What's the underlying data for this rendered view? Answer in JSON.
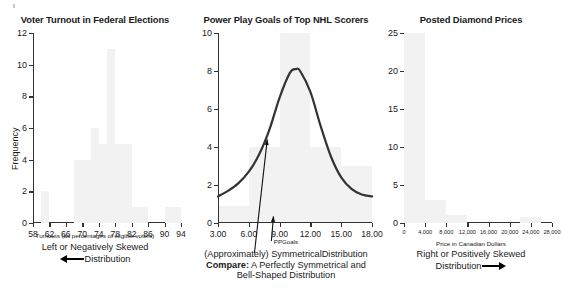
{
  "page": {
    "kind": "three-panel-skewness-figure",
    "background": "#ffffff",
    "bar_color": "#f2f2f2",
    "curve_color": "#333333"
  },
  "chart_data": [
    {
      "type": "bar",
      "panel": 1,
      "title": "Voter Turnout in Federal Elections",
      "xlabel": "Turnouts (as percentages of eligible voters)",
      "ylabel": "Frequency",
      "xlim": [
        58,
        94
      ],
      "ylim": [
        0,
        12
      ],
      "grid": false,
      "legend": "none",
      "xticks": [
        58,
        62,
        66,
        70,
        74,
        78,
        82,
        86,
        90,
        94
      ],
      "xtick_labels": [
        "58",
        "62",
        "66",
        "70",
        "74",
        "78",
        "82",
        "86",
        "90",
        "94"
      ],
      "yticks": [
        0,
        2,
        4,
        6,
        8,
        10,
        12
      ],
      "ytick_labels": [
        "0",
        "2",
        "4",
        "6",
        "8",
        "10",
        "12"
      ],
      "bin_width": 2,
      "bins": [
        {
          "x0": 60,
          "x1": 62,
          "value": 2
        },
        {
          "x0": 68,
          "x1": 70,
          "value": 4
        },
        {
          "x0": 70,
          "x1": 72,
          "value": 4
        },
        {
          "x0": 72,
          "x1": 74,
          "value": 6
        },
        {
          "x0": 74,
          "x1": 76,
          "value": 5
        },
        {
          "x0": 76,
          "x1": 78,
          "value": 11
        },
        {
          "x0": 78,
          "x1": 80,
          "value": 5
        },
        {
          "x0": 80,
          "x1": 82,
          "value": 5
        },
        {
          "x0": 82,
          "x1": 86,
          "value": 1
        },
        {
          "x0": 90,
          "x1": 94,
          "value": 1
        }
      ],
      "caption_line1": "Left or Negatively Skewed",
      "caption_line2": "Distribution",
      "caption_arrow": "left-arrow"
    },
    {
      "type": "line",
      "panel": 2,
      "title": "Power Play Goals of Top NHL Scorers",
      "xlabel": "PPGoals",
      "ylabel": "",
      "xlim": [
        3.0,
        18.0
      ],
      "ylim": [
        0,
        10
      ],
      "grid": false,
      "legend": "none",
      "xticks": [
        3.0,
        6.0,
        9.0,
        12.0,
        15.0,
        18.0
      ],
      "xtick_labels": [
        "3.00",
        "6.00",
        "9.00",
        "12.00",
        "15.00",
        "18.00"
      ],
      "yticks": [
        0,
        2,
        4,
        6,
        8,
        10
      ],
      "ytick_labels": [
        "0",
        "2",
        "4",
        "6",
        "8",
        "10"
      ],
      "curve": {
        "name": "Normal density overlay",
        "peak_x": 10.6,
        "peak_y": 8.1,
        "x": [
          3.0,
          4.0,
          5.0,
          6.0,
          7.0,
          8.0,
          9.0,
          10.0,
          10.6,
          11.0,
          12.0,
          13.0,
          14.0,
          15.0,
          16.0,
          17.0,
          18.0
        ],
        "y": [
          1.4,
          1.7,
          2.1,
          2.7,
          3.6,
          4.9,
          6.6,
          7.9,
          8.1,
          8.0,
          6.9,
          5.1,
          3.5,
          2.4,
          1.8,
          1.5,
          1.4
        ]
      },
      "bins": [
        {
          "x0": 3.0,
          "x1": 6.0,
          "value": 0.9
        },
        {
          "x0": 6.0,
          "x1": 9.0,
          "value": 4.0
        },
        {
          "x0": 9.0,
          "x1": 12.0,
          "value": 10.0
        },
        {
          "x0": 12.0,
          "x1": 15.0,
          "value": 4.0
        },
        {
          "x0": 15.0,
          "x1": 18.0,
          "value": 3.0
        }
      ],
      "annotations": [
        {
          "name": "curve-arrow",
          "label": "points at the fitted bell curve",
          "tip_x": 7.8,
          "tip_y": 4.4
        },
        {
          "name": "axis-arrow",
          "label": "points at the horizontal axis",
          "tip_x": 8.4,
          "tip_y": 0.35
        }
      ],
      "caption_line1": "(Approximately) SymmetricalDistribution",
      "caption_line2_bold": "Compare:",
      "caption_line2": " A Perfectly Symmetrical and",
      "caption_line3": "Bell-Shaped Distribution"
    },
    {
      "type": "bar",
      "panel": 3,
      "title": "Posted Diamond Prices",
      "xlabel": "Price in Canadian Dollars",
      "ylabel": "",
      "xlim": [
        0,
        28000
      ],
      "ylim": [
        0,
        25
      ],
      "grid": false,
      "legend": "none",
      "xticks": [
        0,
        4000,
        8000,
        12000,
        16000,
        20000,
        24000,
        28000
      ],
      "xtick_labels": [
        "0",
        "4,000",
        "8,000",
        "12,000",
        "16,000",
        "20,000",
        "24,000",
        "28,000"
      ],
      "yticks": [
        0,
        5,
        10,
        15,
        20,
        25
      ],
      "ytick_labels": [
        "0",
        "5",
        "10",
        "15",
        "20",
        "25"
      ],
      "bins": [
        {
          "x0": 0,
          "x1": 4000,
          "value": 25
        },
        {
          "x0": 4000,
          "x1": 8000,
          "value": 3
        },
        {
          "x0": 8000,
          "x1": 12000,
          "value": 1
        },
        {
          "x0": 22000,
          "x1": 26000,
          "value": 0.8
        }
      ],
      "caption_line1": "Right or Positively Skewed",
      "caption_line2": "Distribution",
      "caption_arrow": "right-arrow"
    }
  ]
}
